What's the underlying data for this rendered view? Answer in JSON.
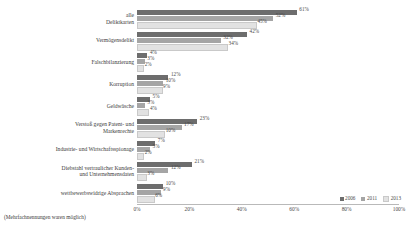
{
  "chart_data": {
    "type": "bar",
    "orientation": "horizontal",
    "title": "",
    "xlabel": "",
    "ylabel": "",
    "xlim": [
      0,
      100
    ],
    "xticks": [
      "0%",
      "20%",
      "40%",
      "60%",
      "80%",
      "100%"
    ],
    "xtick_values": [
      0,
      20,
      40,
      60,
      80,
      100
    ],
    "grid": false,
    "legend_position": "bottom-right",
    "categories": [
      "alle\nDeliktkarten",
      "Vermögensdelikt",
      "Falschbilanzierung",
      "Korruption",
      "Geldwäsche",
      "Verstoß gegen Patent- und\nMarkenrechte",
      "Industrie- und Wirtschaftsspionage",
      "Diebstahl vertraulicher Kunden-\nund Unternehmensdaten",
      "wettbewerbswidrige Absprachen"
    ],
    "series": [
      {
        "name": "2006",
        "color": "#6d6d6d",
        "values": [
          61,
          42,
          4,
          12,
          5,
          23,
          7,
          21,
          10
        ],
        "labels": [
          "61%",
          "42%",
          "4%",
          "12%",
          "5%",
          "23%",
          "7%",
          "21%",
          "10%"
        ]
      },
      {
        "name": "2011",
        "color": "#a5a5a5",
        "values": [
          52,
          32,
          3,
          10,
          3,
          17,
          5,
          12,
          9
        ],
        "labels": [
          "52%",
          "32%",
          "3%",
          "10%",
          "3%",
          "17%",
          "5%",
          "12%",
          "9%"
        ]
      },
      {
        "name": "2013",
        "color": "#e2e2e2",
        "values": [
          45,
          34,
          2,
          9,
          4,
          10,
          2,
          3,
          6
        ],
        "labels": [
          "45%",
          "34%",
          "2%",
          "9%",
          "4%",
          "10%",
          "2%",
          "3%",
          "6%"
        ]
      }
    ],
    "footnote": "(Mehrfachnennungen waren möglich)"
  }
}
